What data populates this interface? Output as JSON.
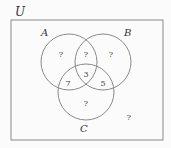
{
  "diagram": {
    "type": "venn",
    "universe_label": "U",
    "sets": [
      {
        "name": "A",
        "label": "A"
      },
      {
        "name": "B",
        "label": "B"
      },
      {
        "name": "C",
        "label": "C"
      }
    ],
    "regions": {
      "A_only": "?",
      "A_and_B_only": "?",
      "B_only": "?",
      "A_and_C_only": "7",
      "A_and_B_and_C": "3",
      "B_and_C_only": "5",
      "C_only": "?",
      "outside": "?"
    },
    "colors": {
      "stroke": "#888888",
      "background": "#fbfbfb"
    }
  }
}
